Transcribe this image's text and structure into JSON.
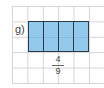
{
  "figure": {
    "label": "g)",
    "segments": 4,
    "fraction": {
      "numerator": "4",
      "denominator": "9"
    },
    "colors": {
      "fill": "#93c9ec",
      "outline": "#2b3a48",
      "grid": "#d4d4d4"
    }
  }
}
